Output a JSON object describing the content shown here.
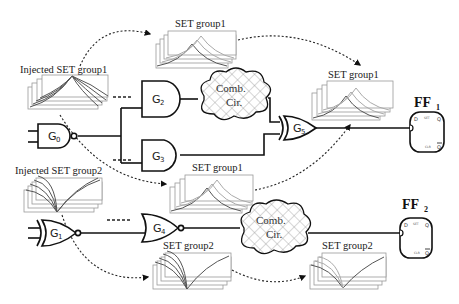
{
  "diagram": {
    "gates": [
      {
        "id": "G0",
        "base": "G",
        "sub": "0",
        "type": "NAND"
      },
      {
        "id": "G1",
        "base": "G",
        "sub": "1",
        "type": "XNOR"
      },
      {
        "id": "G2",
        "base": "G",
        "sub": "2",
        "type": "AND"
      },
      {
        "id": "G3",
        "base": "G",
        "sub": "3",
        "type": "AND"
      },
      {
        "id": "G4",
        "base": "G",
        "sub": "4",
        "type": "NOR"
      },
      {
        "id": "G5",
        "base": "G",
        "sub": "5",
        "type": "XOR"
      }
    ],
    "clouds": [
      {
        "line1": "Comb.",
        "line2": "Cir."
      },
      {
        "line1": "Comb.",
        "line2": "Cir."
      }
    ],
    "flipflops": [
      {
        "base": "FF",
        "sub": "1",
        "pins": {
          "d": "D",
          "set": "SET",
          "q": "Q",
          "clr": "CLR",
          "qbar": "Q"
        }
      },
      {
        "base": "FF",
        "sub": "2",
        "pins": {
          "d": "D",
          "set": "SET",
          "q": "Q",
          "clr": "CLR",
          "qbar": "Q"
        }
      }
    ],
    "labels": {
      "injected1": "Injected SET group1",
      "injected2": "Injected SET group2",
      "set1_top": "SET group1",
      "set1_right": "SET group1",
      "set1_mid": "SET group1",
      "set2_lower": "SET group2",
      "set2_right": "SET group2"
    },
    "colors": {
      "line": "#111111",
      "frame": "#999999",
      "wave_dark": "#555555",
      "wave_light": "#aaaaaa",
      "cloud_hatch": "#888888"
    }
  }
}
